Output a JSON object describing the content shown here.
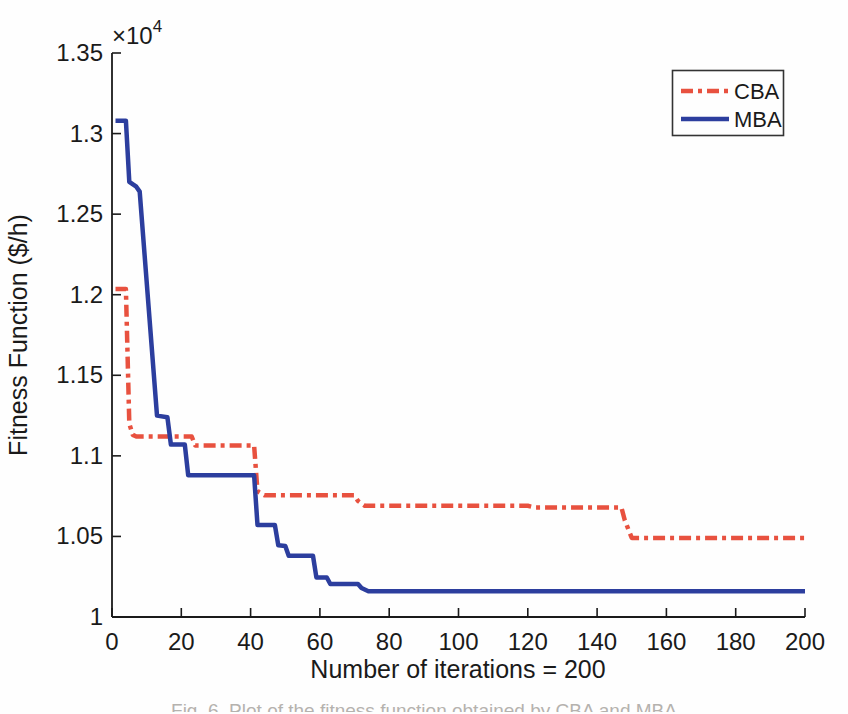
{
  "figure": {
    "background": "#fefefe",
    "axis_color": "#1a1a1a",
    "xlabel": "Number of iterations = 200",
    "ylabel": "Fitness Function ($/h)",
    "exponent": {
      "base": "×10",
      "power": "4"
    },
    "caption_partial": "Fig. 6. Plot of the fitness function obtained by CBA and MBA"
  },
  "legend": {
    "position": "upper-right",
    "entries": [
      {
        "label": "CBA",
        "style": "dash-dot",
        "color": "#e8513f"
      },
      {
        "label": "MBA",
        "style": "solid",
        "color": "#2c3e9e"
      }
    ]
  },
  "chart_data": {
    "type": "line",
    "title": "",
    "xlabel": "Number of iterations = 200",
    "ylabel": "Fitness Function ($/h)",
    "grid": false,
    "legend_position": "upper right",
    "x_axis": {
      "min": 0,
      "max": 200,
      "ticks": [
        0,
        20,
        40,
        60,
        80,
        100,
        120,
        140,
        160,
        180,
        200
      ]
    },
    "y_axis": {
      "min": 10000,
      "max": 13500,
      "multiplier": "×10^4",
      "ticks": [
        10000,
        10500,
        11000,
        11500,
        12000,
        12500,
        13000,
        13500
      ],
      "tick_labels": [
        "1",
        "1.05",
        "1.1",
        "1.15",
        "1.2",
        "1.25",
        "1.3",
        "1.35"
      ]
    },
    "series": [
      {
        "name": "CBA",
        "color": "#e8513f",
        "style": "dash-dot",
        "line_width": 4.5,
        "points": [
          [
            1,
            12035
          ],
          [
            4,
            12035
          ],
          [
            5,
            11200
          ],
          [
            6,
            11130
          ],
          [
            7,
            11120
          ],
          [
            23,
            11120
          ],
          [
            24,
            11065
          ],
          [
            41,
            11065
          ],
          [
            42,
            10780
          ],
          [
            44,
            10755
          ],
          [
            70,
            10755
          ],
          [
            71,
            10720
          ],
          [
            73,
            10690
          ],
          [
            120,
            10690
          ],
          [
            122,
            10680
          ],
          [
            147,
            10680
          ],
          [
            148,
            10600
          ],
          [
            150,
            10490
          ],
          [
            200,
            10490
          ]
        ]
      },
      {
        "name": "MBA",
        "color": "#2c3e9e",
        "style": "solid",
        "line_width": 4.5,
        "points": [
          [
            1,
            13080
          ],
          [
            4,
            13080
          ],
          [
            5,
            12700
          ],
          [
            7,
            12670
          ],
          [
            8,
            12640
          ],
          [
            13,
            11250
          ],
          [
            16,
            11240
          ],
          [
            17,
            11070
          ],
          [
            21,
            11070
          ],
          [
            22,
            10880
          ],
          [
            41,
            10880
          ],
          [
            42,
            10570
          ],
          [
            47,
            10570
          ],
          [
            48,
            10445
          ],
          [
            50,
            10440
          ],
          [
            51,
            10380
          ],
          [
            58,
            10380
          ],
          [
            59,
            10245
          ],
          [
            62,
            10245
          ],
          [
            63,
            10205
          ],
          [
            71,
            10205
          ],
          [
            72,
            10180
          ],
          [
            74,
            10160
          ],
          [
            200,
            10160
          ]
        ]
      }
    ]
  }
}
